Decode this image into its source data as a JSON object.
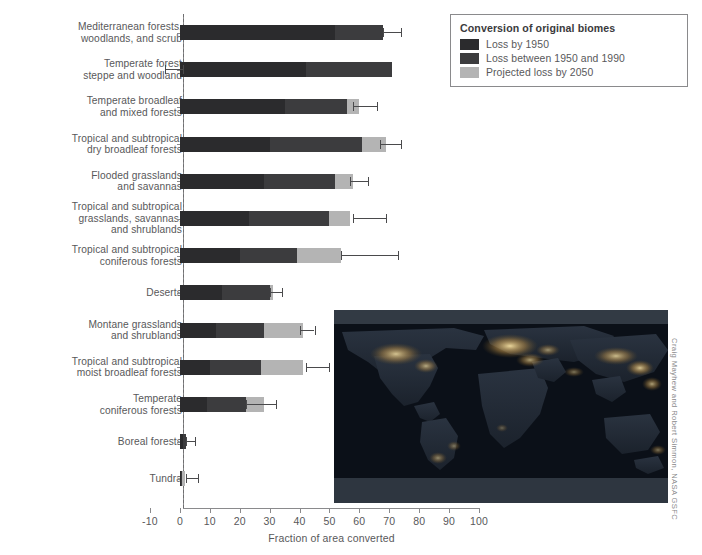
{
  "chart_data": {
    "type": "bar",
    "orientation": "horizontal",
    "stacked": true,
    "title": "",
    "xlabel": "Fraction of area converted",
    "ylabel": "",
    "xlim": [
      -10,
      100
    ],
    "xticks": [
      -10,
      0,
      10,
      20,
      30,
      40,
      50,
      60,
      70,
      80,
      90,
      100
    ],
    "grid": false,
    "zero_reference_line": true,
    "legend": {
      "title": "Conversion of original biomes",
      "position": "top-right",
      "entries": [
        {
          "label": "Loss by 1950",
          "color": "#2b2b2d"
        },
        {
          "label": "Loss between 1950 and 1990",
          "color": "#3c3c3e"
        },
        {
          "label": "Projected loss by 2050",
          "color": "#b4b4b4"
        }
      ]
    },
    "categories": [
      "Mediterranean forests, woodlands, and scrub",
      "Temperate forest steppe and woodland",
      "Temperate broadleaf and mixed forests",
      "Tropical and subtropical dry broadleaf forests",
      "Flooded grasslands and savannas",
      "Tropical and subtropical grasslands, savannas, and shrublands",
      "Tropical and subtropical coniferous forests",
      "Deserts",
      "Montane grasslands and shrublands",
      "Tropical and subtropical moist broadleaf forests",
      "Temperate coniferous forests",
      "Boreal forests",
      "Tundra"
    ],
    "series": [
      {
        "name": "Loss by 1950",
        "values": [
          52,
          42,
          35,
          30,
          28,
          23,
          20,
          14,
          12,
          10,
          9,
          1.0,
          0.4
        ]
      },
      {
        "name": "Loss between 1950 and 1990",
        "values": [
          16,
          29,
          21,
          31,
          24,
          27,
          19,
          16,
          16,
          17,
          13,
          1.0,
          0.4
        ]
      },
      {
        "name": "Projected loss by 2050",
        "values": [
          0,
          0,
          4,
          8,
          6,
          7,
          15,
          1,
          13,
          14,
          6,
          0,
          1.0
        ]
      }
    ],
    "totals": [
      68,
      71,
      60,
      69,
      58,
      57,
      54,
      31,
      41,
      41,
      28,
      2.0,
      1.8
    ],
    "error_bars": [
      {
        "category": "Mediterranean forests, woodlands, and scrub",
        "at": 68,
        "low": 68,
        "high": 74
      },
      {
        "category": "Temperate forest steppe and woodland",
        "at": 0,
        "low": -5,
        "high": 1
      },
      {
        "category": "Temperate broadleaf and mixed forests",
        "at": 60,
        "low": 58,
        "high": 66
      },
      {
        "category": "Tropical and subtropical dry broadleaf forests",
        "at": 69,
        "low": 67,
        "high": 74
      },
      {
        "category": "Flooded grasslands and savannas",
        "at": 58,
        "low": 57,
        "high": 63
      },
      {
        "category": "Tropical and subtropical grasslands, savannas, and shrublands",
        "at": 57,
        "low": 58,
        "high": 69
      },
      {
        "category": "Tropical and subtropical coniferous forests",
        "at": 54,
        "low": 54,
        "high": 73
      },
      {
        "category": "Deserts",
        "at": 31,
        "low": 30,
        "high": 34
      },
      {
        "category": "Montane grasslands and shrublands",
        "at": 41,
        "low": 40,
        "high": 45
      },
      {
        "category": "Tropical and subtropical moist broadleaf forests",
        "at": 41,
        "low": 42,
        "high": 50
      },
      {
        "category": "Temperate coniferous forests",
        "at": 28,
        "low": 22,
        "high": 32
      },
      {
        "category": "Boreal forests",
        "at": 2.0,
        "low": 2,
        "high": 5
      },
      {
        "category": "Tundra",
        "at": 1.8,
        "low": 2,
        "high": 6
      }
    ]
  },
  "axis": {
    "x_title": "Fraction of area converted",
    "tick_labels": [
      "-10",
      "0",
      "10",
      "20",
      "30",
      "40",
      "50",
      "60",
      "70",
      "80",
      "90",
      "100"
    ]
  },
  "legend": {
    "title": "Conversion of original biomes",
    "items": [
      {
        "label": "Loss by 1950"
      },
      {
        "label": "Loss between 1950 and 1990"
      },
      {
        "label": "Projected loss by 2050"
      }
    ]
  },
  "categories": [
    {
      "line1": "Mediterranean forests,",
      "line2": "woodlands, and scrub",
      "line3": ""
    },
    {
      "line1": "Temperate forest",
      "line2": "steppe and woodland",
      "line3": ""
    },
    {
      "line1": "Temperate broadleaf",
      "line2": "and mixed forests",
      "line3": ""
    },
    {
      "line1": "Tropical and subtropical",
      "line2": "dry broadleaf forests",
      "line3": ""
    },
    {
      "line1": "Flooded grasslands",
      "line2": "and savannas",
      "line3": ""
    },
    {
      "line1": "Tropical and subtropical",
      "line2": "grasslands, savannas,",
      "line3": "and shrublands"
    },
    {
      "line1": "Tropical and subtropical",
      "line2": "coniferous forests",
      "line3": ""
    },
    {
      "line1": "Deserts",
      "line2": "",
      "line3": ""
    },
    {
      "line1": "Montane grasslands",
      "line2": "and shrublands",
      "line3": ""
    },
    {
      "line1": "Tropical and subtropical",
      "line2": "moist broadleaf forests",
      "line3": ""
    },
    {
      "line1": "Temperate",
      "line2": "coniferous forests",
      "line3": ""
    },
    {
      "line1": "Boreal forests",
      "line2": "",
      "line3": ""
    },
    {
      "line1": "Tundra",
      "line2": "",
      "line3": ""
    }
  ],
  "inset": {
    "name": "earth-at-night-world-map",
    "credit": "Craig Mayhew and Robert Simmon, NASA GSFC"
  },
  "colors": {
    "loss_1950": "#2b2b2d",
    "loss_1950_1990": "#3c3c3e",
    "projected_2050": "#b4b4b4",
    "axis": "#8a8a8c",
    "text": "#58585a"
  }
}
